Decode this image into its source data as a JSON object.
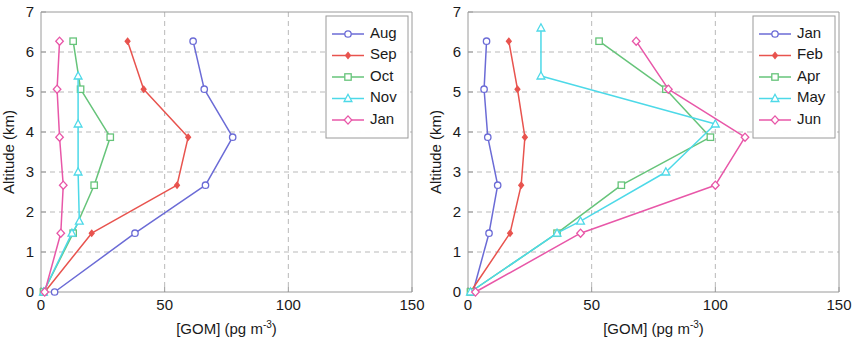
{
  "figure": {
    "panel_count": 2,
    "background": "#ffffff"
  },
  "axes": {
    "xlabel_main": "[GOM] (pg m",
    "xlabel_sup": "-3",
    "xlabel_tail": ")",
    "ylabel": "Altitude (km)",
    "xticks": [
      "0",
      "50",
      "100",
      "150"
    ],
    "yticks": [
      "0",
      "1",
      "2",
      "3",
      "4",
      "5",
      "6",
      "7"
    ]
  },
  "colors": {
    "blue": "#6B6BD6",
    "red": "#E8534E",
    "green": "#66C47A",
    "cyan": "#4DD9E8",
    "magenta": "#E857A8",
    "grid": "#b9b9b9",
    "axis": "#9a9a9a",
    "text": "#1a1a1a"
  },
  "chart_data": [
    {
      "type": "line",
      "panel": "left",
      "title": "",
      "xlabel": "[GOM] (pg m-3)",
      "ylabel": "Altitude (km)",
      "xlim": [
        0,
        150
      ],
      "ylim": [
        0,
        7
      ],
      "xticks": [
        0,
        50,
        100,
        150
      ],
      "yticks": [
        0,
        1,
        2,
        3,
        4,
        5,
        6,
        7
      ],
      "grid": true,
      "legend_position": "top-right",
      "orientation": "x=concentration, y=altitude",
      "series": [
        {
          "name": "Aug",
          "color": "#6B6BD6",
          "marker": "circle-open",
          "x": [
            5.5,
            38.0,
            66.5,
            77.5,
            66.0,
            61.5
          ],
          "y": [
            0.0,
            1.47,
            2.67,
            3.87,
            5.07,
            6.27
          ]
        },
        {
          "name": "Sep",
          "color": "#E8534E",
          "marker": "diamond-filled",
          "x": [
            1.5,
            20.5,
            55.0,
            59.5,
            41.5,
            35.0
          ],
          "y": [
            0.0,
            1.47,
            2.67,
            3.87,
            5.07,
            6.27
          ]
        },
        {
          "name": "Oct",
          "color": "#66C47A",
          "marker": "square-open",
          "x": [
            1.0,
            13.0,
            21.5,
            28.0,
            16.0,
            13.0
          ],
          "y": [
            0.0,
            1.47,
            2.67,
            3.87,
            5.07,
            6.27
          ]
        },
        {
          "name": "Nov",
          "color": "#4DD9E8",
          "marker": "triangle-open",
          "x": [
            1.0,
            12.5,
            15.5,
            15.0,
            15.0,
            15.0
          ],
          "y": [
            0.0,
            1.47,
            1.77,
            3.0,
            4.2,
            5.4
          ]
        },
        {
          "name": "Jan",
          "color": "#E857A8",
          "marker": "diamond-open",
          "x": [
            1.5,
            8.0,
            9.0,
            7.5,
            6.5,
            7.5
          ],
          "y": [
            0.0,
            1.47,
            2.67,
            3.87,
            5.07,
            6.27
          ]
        }
      ]
    },
    {
      "type": "line",
      "panel": "right",
      "title": "",
      "xlabel": "[GOM] (pg m-3)",
      "ylabel": "Altitude (km)",
      "xlim": [
        0,
        150
      ],
      "ylim": [
        0,
        7
      ],
      "xticks": [
        0,
        50,
        100,
        150
      ],
      "yticks": [
        0,
        1,
        2,
        3,
        4,
        5,
        6,
        7
      ],
      "grid": true,
      "legend_position": "top-right",
      "orientation": "x=concentration, y=altitude",
      "series": [
        {
          "name": "Jan",
          "color": "#6B6BD6",
          "marker": "circle-open",
          "x": [
            2.0,
            8.5,
            12.0,
            8.0,
            6.5,
            7.5
          ],
          "y": [
            0.0,
            1.47,
            2.67,
            3.87,
            5.07,
            6.27
          ]
        },
        {
          "name": "Feb",
          "color": "#E8534E",
          "marker": "diamond-filled",
          "x": [
            1.0,
            17.0,
            21.5,
            23.0,
            20.0,
            16.5
          ],
          "y": [
            0.0,
            1.47,
            2.67,
            3.87,
            5.07,
            6.27
          ]
        },
        {
          "name": "Apr",
          "color": "#66C47A",
          "marker": "square-open",
          "x": [
            1.0,
            36.0,
            62.0,
            98.0,
            80.0,
            53.0
          ],
          "y": [
            0.0,
            1.47,
            2.67,
            3.87,
            5.07,
            6.27
          ]
        },
        {
          "name": "May",
          "color": "#4DD9E8",
          "marker": "triangle-open",
          "x": [
            1.0,
            36.0,
            45.5,
            80.0,
            100.0,
            29.5,
            29.5
          ],
          "y": [
            0.0,
            1.47,
            1.77,
            3.0,
            4.2,
            5.4,
            6.6
          ]
        },
        {
          "name": "Jun",
          "color": "#E857A8",
          "marker": "diamond-open",
          "x": [
            3.0,
            45.5,
            100.0,
            112.0,
            81.0,
            68.0
          ],
          "y": [
            0.0,
            1.47,
            2.67,
            3.87,
            5.07,
            6.27
          ]
        }
      ]
    }
  ],
  "legends": {
    "left": {
      "entries": [
        {
          "label": "Aug",
          "color": "#6B6BD6",
          "marker": "circle-open"
        },
        {
          "label": "Sep",
          "color": "#E8534E",
          "marker": "diamond-filled"
        },
        {
          "label": "Oct",
          "color": "#66C47A",
          "marker": "square-open"
        },
        {
          "label": "Nov",
          "color": "#4DD9E8",
          "marker": "triangle-open"
        },
        {
          "label": "Jan",
          "color": "#E857A8",
          "marker": "diamond-open"
        }
      ]
    },
    "right": {
      "entries": [
        {
          "label": "Jan",
          "color": "#6B6BD6",
          "marker": "circle-open"
        },
        {
          "label": "Feb",
          "color": "#E8534E",
          "marker": "diamond-filled"
        },
        {
          "label": "Apr",
          "color": "#66C47A",
          "marker": "square-open"
        },
        {
          "label": "May",
          "color": "#4DD9E8",
          "marker": "triangle-open"
        },
        {
          "label": "Jun",
          "color": "#E857A8",
          "marker": "diamond-open"
        }
      ]
    }
  }
}
